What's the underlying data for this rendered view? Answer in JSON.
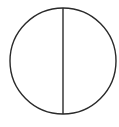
{
  "diagram": {
    "shape": "circle-with-vertical-diameter",
    "stroke_color": "#2a2a2a",
    "background": "#ffffff"
  }
}
